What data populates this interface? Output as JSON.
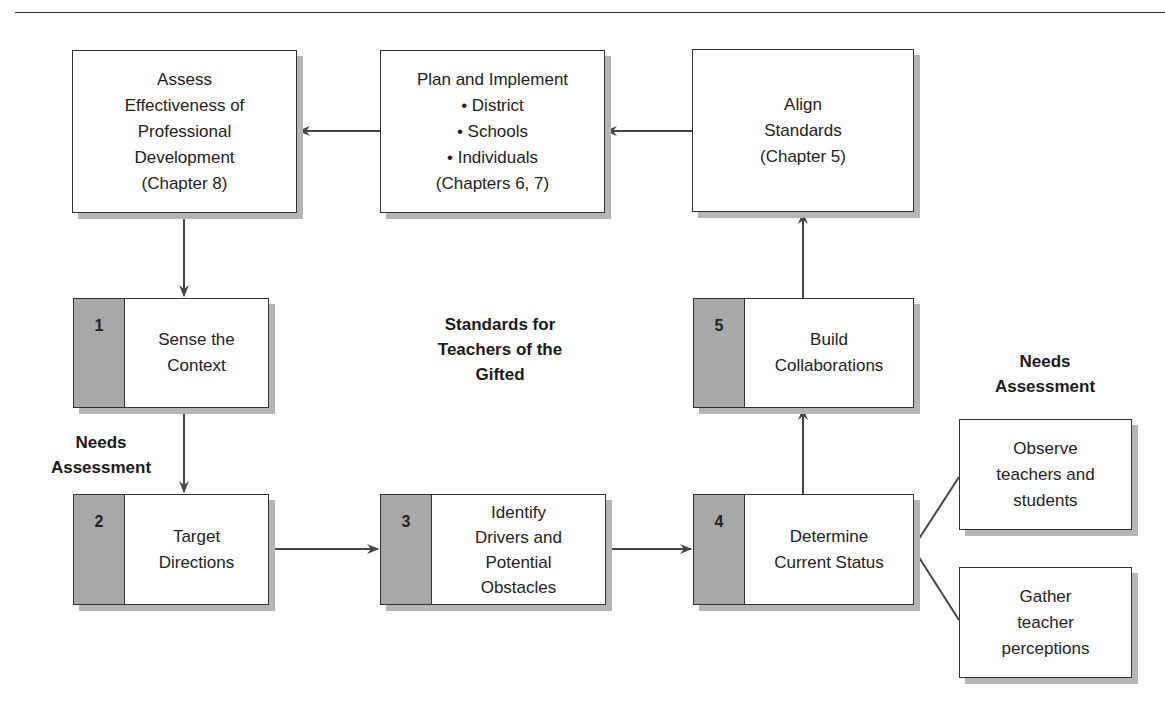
{
  "diagram": {
    "top_boxes": {
      "assess": "Assess\nEffectiveness of\nProfessional\nDevelopment\n(Chapter 8)",
      "plan": "Plan and Implement\n• District\n• Schools\n• Individuals\n(Chapters 6, 7)",
      "align": "Align\nStandards\n(Chapter 5)"
    },
    "steps": [
      {
        "number": "1",
        "label": "Sense the\nContext"
      },
      {
        "number": "2",
        "label": "Target\nDirections"
      },
      {
        "number": "3",
        "label": "Identify\nDrivers and\nPotential\nObstacles"
      },
      {
        "number": "4",
        "label": "Determine\nCurrent Status"
      },
      {
        "number": "5",
        "label": "Build\nCollaborations"
      }
    ],
    "side_boxes": {
      "observe": "Observe\nteachers and\nstudents",
      "gather": "Gather\nteacher\nperceptions"
    },
    "headings": {
      "center": "Standards for\nTeachers of the\nGifted",
      "needs_left": "Needs\nAssessment",
      "needs_right": "Needs\nAssessment"
    },
    "colors": {
      "line": "#444444",
      "step_number_fill": "#a8a8a8",
      "shadow": "#b5b5b5"
    }
  }
}
